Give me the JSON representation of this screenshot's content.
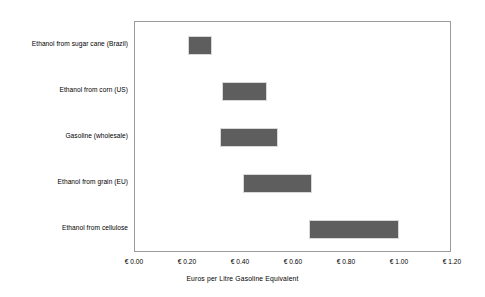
{
  "chart_data": {
    "type": "bar",
    "orientation": "horizontal",
    "subtype": "range-bar",
    "title": "",
    "xlabel": "Euros per Litre Gasoline Equivalent",
    "ylabel": "",
    "xlim": [
      0.0,
      1.2
    ],
    "xticks": [
      0.0,
      0.2,
      0.4,
      0.6,
      0.8,
      1.0,
      1.2
    ],
    "xtick_labels": [
      "€ 0.00",
      "€ 0.20",
      "€ 0.40",
      "€ 0.60",
      "€ 0.80",
      "€ 1.00",
      "€ 1.20"
    ],
    "grid": false,
    "legend": false,
    "bar_color": "#5e5e5e",
    "frame_color": "#9a9a9a",
    "categories": [
      "Ethanol from sugar cane (Brazil)",
      "Ethanol from corn (US)",
      "Gasoline (wholesale)",
      "Ethanol from grain (EU)",
      "Ethanol from cellulose"
    ],
    "ranges": [
      {
        "label": "Ethanol from sugar cane (Brazil)",
        "low": 0.2,
        "high": 0.29
      },
      {
        "label": "Ethanol from corn (US)",
        "low": 0.33,
        "high": 0.5
      },
      {
        "label": "Gasoline (wholesale)",
        "low": 0.32,
        "high": 0.54
      },
      {
        "label": "Ethanol from grain (EU)",
        "low": 0.41,
        "high": 0.67
      },
      {
        "label": "Ethanol from cellulose",
        "low": 0.66,
        "high": 1.0
      }
    ]
  }
}
